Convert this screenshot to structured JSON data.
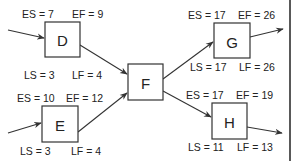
{
  "diagram": {
    "type": "critical-path-network",
    "nodes": {
      "D": {
        "label": "D",
        "es": "ES = 7",
        "ef": "EF = 9",
        "ls": "LS = 3",
        "lf": "LF = 4"
      },
      "E": {
        "label": "E",
        "es": "ES = 10",
        "ef": "EF = 12",
        "ls": "LS = 3",
        "lf": "LF = 4"
      },
      "F": {
        "label": "F"
      },
      "G": {
        "label": "G",
        "es": "ES = 17",
        "ef": "EF = 26",
        "ls": "LS = 17",
        "lf": "LF = 26"
      },
      "H": {
        "label": "H",
        "es": "ES = 17",
        "ef": "EF = 19",
        "ls": "LS = 11",
        "lf": "LF = 13"
      }
    },
    "edges": [
      {
        "from": "(left)",
        "to": "D"
      },
      {
        "from": "(left)",
        "to": "E"
      },
      {
        "from": "D",
        "to": "F"
      },
      {
        "from": "E",
        "to": "F"
      },
      {
        "from": "F",
        "to": "G"
      },
      {
        "from": "F",
        "to": "H"
      },
      {
        "from": "G",
        "to": "(right)"
      },
      {
        "from": "H",
        "to": "(right)"
      }
    ],
    "colors": {
      "stroke": "#333333",
      "text": "#222222",
      "background": "#ffffff"
    }
  }
}
